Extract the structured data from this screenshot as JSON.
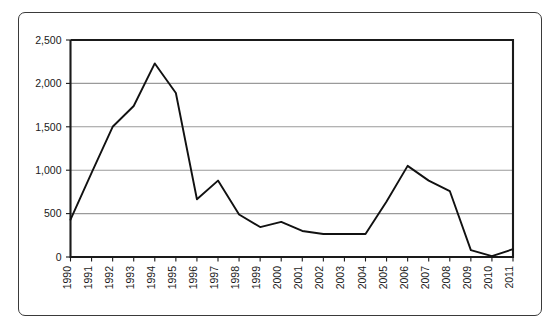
{
  "chart_data": {
    "type": "line",
    "title": "",
    "subtitle": "",
    "xlabel": "",
    "ylabel": "",
    "grid": true,
    "legend": false,
    "legend_position": "none",
    "xlim": [
      "1990",
      "2011"
    ],
    "ylim": [
      0,
      2500
    ],
    "ytick_labels": [
      "0",
      "500",
      "1,000",
      "1,500",
      "2,000",
      "2,500"
    ],
    "ytick_values": [
      0,
      500,
      1000,
      1500,
      2000,
      2500
    ],
    "categories": [
      "1990",
      "1991",
      "1992",
      "1993",
      "1994",
      "1995",
      "1996",
      "1997",
      "1998",
      "1999",
      "2000",
      "2001",
      "2002",
      "2003",
      "2004",
      "2005",
      "2006",
      "2007",
      "2008",
      "2009",
      "2010",
      "2011"
    ],
    "values": [
      430,
      970,
      1500,
      1740,
      2230,
      1890,
      665,
      880,
      490,
      345,
      405,
      300,
      265,
      265,
      265,
      640,
      1050,
      880,
      760,
      80,
      10,
      90
    ],
    "series": [
      {
        "name": "series-1",
        "color": "#111111",
        "values": [
          430,
          970,
          1500,
          1740,
          2230,
          1890,
          665,
          880,
          490,
          345,
          405,
          300,
          265,
          265,
          265,
          640,
          1050,
          880,
          760,
          80,
          10,
          90
        ]
      }
    ]
  },
  "style": {
    "line_color": "#111111",
    "grid_color": "#9a9a9a",
    "axis_color": "#1a1a1a",
    "frame_color": "#3a3a3a",
    "background": "#ffffff"
  }
}
